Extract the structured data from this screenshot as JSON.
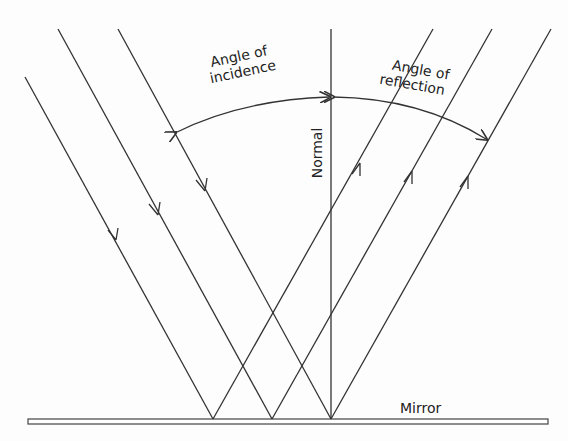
{
  "diagram": {
    "labels": {
      "incidence_line1": "Angle of",
      "incidence_line2": "incidence",
      "reflection_line1": "Angle of",
      "reflection_line2": "reflection",
      "normal": "Normal",
      "mirror": "Mirror"
    },
    "rays": {
      "incident_count": 3,
      "reflected_count": 3
    },
    "colors": {
      "line": "#333333",
      "background": "#fdfdfd"
    }
  }
}
